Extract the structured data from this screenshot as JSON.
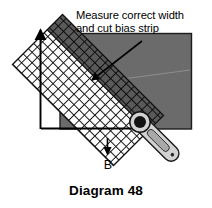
{
  "figure": {
    "caption": "Diagram 48",
    "annotation": "Measure correct width\nand cut bias strip",
    "point_label": "B",
    "colors": {
      "fabric_gray": "#6b6b6b",
      "bias_strip_gray": "#555555",
      "line_black": "#000000",
      "mesh_white": "#ffffff",
      "tool_body": "#cfcfcf",
      "tool_blade": "#1a1a1a",
      "background": "#ffffff"
    },
    "elements": {
      "fabric_label": "gray fabric piece",
      "mesh_label": "crosshatch bias fabric",
      "bias_strip_label": "marked bias strip",
      "tool_label": "rotary cutter",
      "measure_line_label": "vertical measuring line",
      "cut_line_label": "horizontal cut line",
      "pointer_label": "annotation arrow"
    }
  }
}
